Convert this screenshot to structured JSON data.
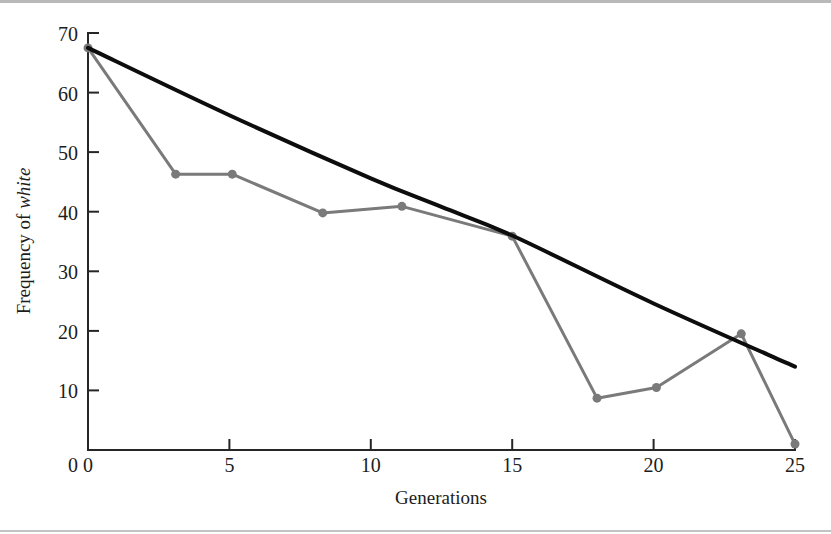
{
  "figure": {
    "background_color": "#ffffff",
    "rule_color": "#bdbdbd"
  },
  "chart_data": {
    "type": "line",
    "title": "",
    "subtitle": "",
    "xlabel": "Generations",
    "ylabel": "Frequency of white",
    "ylabel_plain": "Frequency of ",
    "ylabel_italic": "white",
    "xlim": [
      0,
      25
    ],
    "ylim": [
      0,
      70
    ],
    "xticks": [
      0,
      5,
      10,
      15,
      20,
      25
    ],
    "xtick_labels": [
      "0",
      "5",
      "10",
      "15",
      "20",
      "25"
    ],
    "yticks": [
      0,
      10,
      20,
      30,
      40,
      50,
      60,
      70
    ],
    "ytick_labels": [
      "0",
      "10",
      "20",
      "30",
      "40",
      "50",
      "60",
      "70"
    ],
    "grid": false,
    "legend": "none",
    "legend_position": "none",
    "series": [
      {
        "name": "observed",
        "style": "line-with-markers",
        "color": "#7a7a7a",
        "linewidth": 3,
        "marker": "circle",
        "marker_size": 9,
        "x": [
          0.0,
          3.1,
          5.1,
          8.3,
          11.1,
          15.0,
          18.0,
          20.1,
          23.1,
          25.0
        ],
        "y": [
          67.5,
          46.3,
          46.3,
          39.8,
          40.9,
          35.9,
          8.7,
          10.5,
          19.5,
          1.0
        ]
      },
      {
        "name": "expected",
        "style": "smooth-curve",
        "color": "#0d0d0d",
        "linewidth": 4,
        "marker": "none",
        "x": [
          0.0,
          5.0,
          10.0,
          12.5,
          15.0,
          20.0,
          25.0
        ],
        "y": [
          67.5,
          56.2,
          45.6,
          40.8,
          36.0,
          24.6,
          14.0
        ]
      }
    ]
  }
}
